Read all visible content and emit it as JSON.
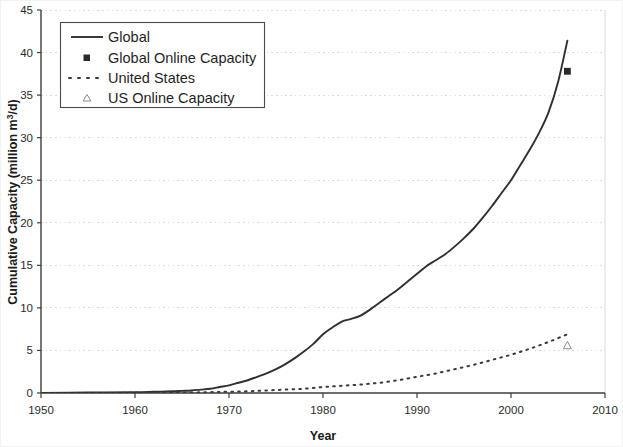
{
  "chart_data": {
    "type": "line",
    "title": "",
    "xlabel": "Year",
    "ylabel": "Cumulative Capacity (million m3/d)",
    "ylabel_parts": {
      "pre": "Cumulative Capacity (million m",
      "sup": "3",
      "post": "/d)"
    },
    "xlim": [
      1950,
      2010
    ],
    "ylim": [
      0,
      45
    ],
    "xticks": [
      1950,
      1960,
      1970,
      1980,
      1990,
      2000,
      2010
    ],
    "yticks": [
      0,
      5,
      10,
      15,
      20,
      25,
      30,
      35,
      40,
      45
    ],
    "grid": "horizontal-dotted",
    "legend_position": "top-left",
    "legend": [
      {
        "label": "Global",
        "marker": "solid-line"
      },
      {
        "label": "Global Online Capacity",
        "marker": "filled-square"
      },
      {
        "label": "United States",
        "marker": "dotted-line"
      },
      {
        "label": "US Online Capacity",
        "marker": "open-triangle"
      }
    ],
    "series": [
      {
        "name": "Global",
        "style": "solid-line",
        "color": "#2f2f2f",
        "x": [
          1950,
          1955,
          1960,
          1962,
          1964,
          1965,
          1966,
          1967,
          1968,
          1969,
          1970,
          1971,
          1972,
          1973,
          1974,
          1975,
          1976,
          1977,
          1978,
          1979,
          1980,
          1981,
          1982,
          1983,
          1984,
          1985,
          1986,
          1987,
          1988,
          1989,
          1990,
          1991,
          1992,
          1993,
          1994,
          1995,
          1996,
          1997,
          1998,
          1999,
          2000,
          2001,
          2002,
          2003,
          2004,
          2005,
          2006
        ],
        "y": [
          0.0,
          0.05,
          0.1,
          0.15,
          0.2,
          0.25,
          0.3,
          0.4,
          0.5,
          0.7,
          0.9,
          1.2,
          1.5,
          1.9,
          2.3,
          2.8,
          3.4,
          4.1,
          4.9,
          5.8,
          6.9,
          7.7,
          8.4,
          8.7,
          9.1,
          9.8,
          10.6,
          11.4,
          12.2,
          13.1,
          14.0,
          14.9,
          15.6,
          16.3,
          17.2,
          18.2,
          19.3,
          20.6,
          22.0,
          23.5,
          25.0,
          26.8,
          28.6,
          30.6,
          33.0,
          36.5,
          41.4
        ]
      },
      {
        "name": "United States",
        "style": "dotted-line",
        "color": "#3a3a3a",
        "x": [
          1950,
          1960,
          1965,
          1968,
          1970,
          1972,
          1974,
          1976,
          1978,
          1980,
          1982,
          1984,
          1986,
          1988,
          1990,
          1992,
          1994,
          1996,
          1998,
          2000,
          2002,
          2004,
          2006
        ],
        "y": [
          0.0,
          0.02,
          0.05,
          0.1,
          0.15,
          0.2,
          0.3,
          0.4,
          0.5,
          0.7,
          0.85,
          1.0,
          1.2,
          1.5,
          1.9,
          2.3,
          2.8,
          3.3,
          3.9,
          4.5,
          5.2,
          6.0,
          6.9
        ]
      }
    ],
    "point_markers": [
      {
        "name": "Global Online Capacity",
        "marker": "filled-square",
        "x": 2006,
        "y": 37.8
      },
      {
        "name": "US Online Capacity",
        "marker": "open-triangle",
        "x": 2006,
        "y": 5.6
      }
    ]
  }
}
